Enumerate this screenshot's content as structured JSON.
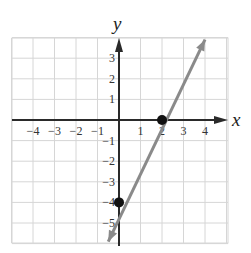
{
  "chart_data": {
    "type": "line",
    "title": "",
    "xlabel": "x",
    "ylabel": "y",
    "xlim": [
      -5,
      5
    ],
    "ylim": [
      -6,
      4
    ],
    "grid": true,
    "x_ticks": [
      -4,
      -3,
      -2,
      -1,
      1,
      2,
      3,
      4
    ],
    "y_ticks": [
      3,
      2,
      1,
      -1,
      -2,
      -3,
      -4,
      -5
    ],
    "x_tick_labels": [
      "−4",
      "−3",
      "−2",
      "−1",
      "1",
      "2",
      "3",
      "4"
    ],
    "y_tick_labels": [
      "3",
      "2",
      "1",
      "−1",
      "−2",
      "−3",
      "−4",
      "−5"
    ],
    "series": [
      {
        "name": "y = 2x − 4",
        "slope": 2,
        "intercept": -4,
        "x": [
          -0.5,
          4.0
        ],
        "y": [
          -5.9,
          3.9
        ],
        "color": "#8a8a8a",
        "arrows": "both"
      }
    ],
    "points": [
      {
        "label": "x-intercept",
        "x": 2,
        "y": 0,
        "color": "#111111"
      },
      {
        "label": "y-intercept",
        "x": 0,
        "y": -4,
        "color": "#111111"
      }
    ]
  },
  "colors": {
    "grid": "#d6d6d6",
    "axis": "#2a2a2a",
    "line": "#8a8a8a",
    "point": "#111111"
  }
}
